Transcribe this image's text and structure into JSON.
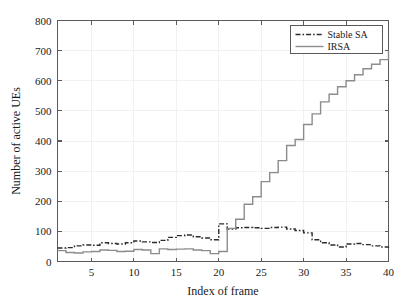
{
  "chart_data": {
    "type": "line",
    "title": "",
    "subtitle": "",
    "xlabel": "Index of frame",
    "ylabel": "Number of active UEs",
    "xlim": [
      1,
      40
    ],
    "ylim": [
      0,
      800
    ],
    "xticks": [
      5,
      10,
      15,
      20,
      25,
      30,
      35,
      40
    ],
    "yticks": [
      0,
      100,
      200,
      300,
      400,
      500,
      600,
      700,
      800
    ],
    "xtick_labels": [
      "5",
      "10",
      "15",
      "20",
      "25",
      "30",
      "35",
      "40"
    ],
    "ytick_labels": [
      "0",
      "100",
      "200",
      "300",
      "400",
      "500",
      "600",
      "700",
      "800"
    ],
    "grid": true,
    "grid_color": "#ededed",
    "drawstyle": "steps-post",
    "legend_position": "upper right",
    "x": [
      1,
      2,
      3,
      4,
      5,
      6,
      7,
      8,
      9,
      10,
      11,
      12,
      13,
      14,
      15,
      16,
      17,
      18,
      19,
      20,
      21,
      22,
      23,
      24,
      25,
      26,
      27,
      28,
      29,
      30,
      31,
      32,
      33,
      34,
      35,
      36,
      37,
      38,
      39,
      40
    ],
    "series": [
      {
        "name": "Stable SA",
        "color": "#2b2b2b",
        "linestyle": "dashdot",
        "linewidth": 1.4,
        "values": [
          45,
          46,
          52,
          55,
          54,
          62,
          60,
          58,
          62,
          68,
          65,
          63,
          70,
          80,
          86,
          88,
          82,
          78,
          72,
          125,
          108,
          112,
          113,
          112,
          110,
          113,
          114,
          108,
          103,
          95,
          72,
          62,
          55,
          48,
          58,
          60,
          56,
          52,
          48,
          50
        ]
      },
      {
        "name": "IRSA",
        "color": "#8c8c8c",
        "linestyle": "solid",
        "linewidth": 1.4,
        "values": [
          36,
          30,
          28,
          32,
          33,
          38,
          37,
          33,
          34,
          40,
          38,
          26,
          42,
          40,
          41,
          42,
          38,
          36,
          26,
          33,
          110,
          140,
          190,
          215,
          265,
          295,
          335,
          385,
          405,
          455,
          490,
          530,
          555,
          580,
          600,
          620,
          640,
          655,
          670,
          700
        ]
      }
    ]
  },
  "legend": {
    "entries": [
      {
        "label": "Stable SA",
        "icon": "dashdot-line-swatch"
      },
      {
        "label": "IRSA",
        "icon": "solid-line-swatch"
      }
    ]
  },
  "axes": {
    "x_title": "Index of frame",
    "y_title": "Number of active UEs"
  }
}
